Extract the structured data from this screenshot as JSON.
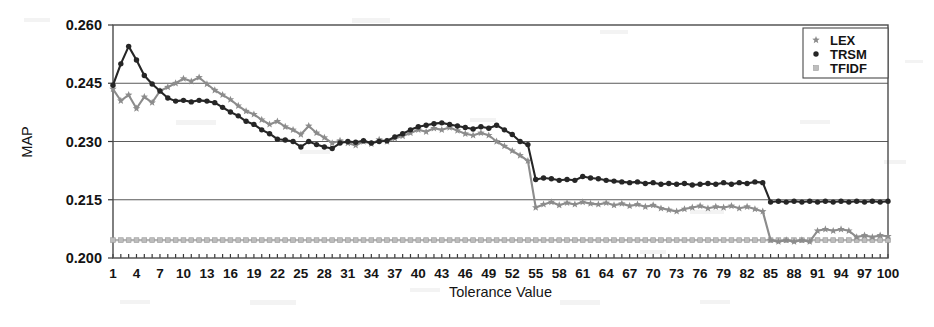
{
  "chart_data": {
    "type": "line",
    "title": "",
    "xlabel": "Tolerance Value",
    "ylabel": "MAP",
    "xlim": [
      1,
      100
    ],
    "ylim": [
      0.2,
      0.26
    ],
    "yticks": [
      "0.200",
      "0.215",
      "0.230",
      "0.245",
      "0.260"
    ],
    "xticks": [
      1,
      4,
      7,
      10,
      13,
      16,
      19,
      22,
      25,
      28,
      31,
      34,
      37,
      40,
      43,
      46,
      49,
      52,
      55,
      58,
      61,
      64,
      67,
      70,
      73,
      76,
      79,
      82,
      85,
      88,
      91,
      94,
      97,
      100
    ],
    "grid": true,
    "legend_position": "top-right",
    "x": [
      1,
      2,
      3,
      4,
      5,
      6,
      7,
      8,
      9,
      10,
      11,
      12,
      13,
      14,
      15,
      16,
      17,
      18,
      19,
      20,
      21,
      22,
      23,
      24,
      25,
      26,
      27,
      28,
      29,
      30,
      31,
      32,
      33,
      34,
      35,
      36,
      37,
      38,
      39,
      40,
      41,
      42,
      43,
      44,
      45,
      46,
      47,
      48,
      49,
      50,
      51,
      52,
      53,
      54,
      55,
      56,
      57,
      58,
      59,
      60,
      61,
      62,
      63,
      64,
      65,
      66,
      67,
      68,
      69,
      70,
      71,
      72,
      73,
      74,
      75,
      76,
      77,
      78,
      79,
      80,
      81,
      82,
      83,
      84,
      85,
      86,
      87,
      88,
      89,
      90,
      91,
      92,
      93,
      94,
      95,
      96,
      97,
      98,
      99,
      100
    ],
    "series": [
      {
        "name": "LEX",
        "marker": "star",
        "color": "#8c8c8c",
        "values": [
          0.2435,
          0.2405,
          0.242,
          0.2385,
          0.2415,
          0.24,
          0.243,
          0.244,
          0.245,
          0.2462,
          0.2455,
          0.2465,
          0.2448,
          0.2432,
          0.242,
          0.2408,
          0.2392,
          0.2378,
          0.237,
          0.2356,
          0.2344,
          0.2352,
          0.2338,
          0.233,
          0.2318,
          0.234,
          0.2322,
          0.231,
          0.2296,
          0.2302,
          0.2296,
          0.229,
          0.23,
          0.2294,
          0.2305,
          0.23,
          0.2308,
          0.2314,
          0.2322,
          0.233,
          0.2325,
          0.2334,
          0.233,
          0.2336,
          0.2328,
          0.232,
          0.2316,
          0.2322,
          0.2316,
          0.23,
          0.2288,
          0.2276,
          0.2264,
          0.225,
          0.213,
          0.2138,
          0.2144,
          0.2136,
          0.2142,
          0.2138,
          0.2144,
          0.214,
          0.2138,
          0.2142,
          0.2136,
          0.214,
          0.2134,
          0.2138,
          0.2132,
          0.2136,
          0.2128,
          0.2124,
          0.212,
          0.2126,
          0.213,
          0.2134,
          0.2128,
          0.2132,
          0.213,
          0.2134,
          0.2128,
          0.2132,
          0.2126,
          0.212,
          0.2046,
          0.2042,
          0.2046,
          0.2042,
          0.2046,
          0.2042,
          0.207,
          0.2074,
          0.207,
          0.2074,
          0.207,
          0.2054,
          0.2058,
          0.2054,
          0.2058,
          0.2056
        ]
      },
      {
        "name": "TRSM",
        "marker": "circle",
        "color": "#262626",
        "values": [
          0.2445,
          0.25,
          0.2545,
          0.251,
          0.247,
          0.2448,
          0.243,
          0.2412,
          0.2404,
          0.2406,
          0.2402,
          0.2406,
          0.2404,
          0.24,
          0.2388,
          0.2376,
          0.2366,
          0.2352,
          0.2344,
          0.233,
          0.232,
          0.2306,
          0.2304,
          0.23,
          0.2286,
          0.23,
          0.2292,
          0.2286,
          0.2282,
          0.2296,
          0.23,
          0.2298,
          0.2302,
          0.2296,
          0.23,
          0.2302,
          0.2312,
          0.232,
          0.233,
          0.2338,
          0.2342,
          0.2346,
          0.2348,
          0.2344,
          0.234,
          0.2336,
          0.2332,
          0.2338,
          0.2334,
          0.2342,
          0.233,
          0.2318,
          0.23,
          0.2292,
          0.2202,
          0.2206,
          0.2204,
          0.22,
          0.2202,
          0.22,
          0.221,
          0.2206,
          0.2204,
          0.22,
          0.2198,
          0.2196,
          0.2194,
          0.2196,
          0.2192,
          0.2194,
          0.219,
          0.2192,
          0.219,
          0.2192,
          0.2188,
          0.219,
          0.2192,
          0.219,
          0.2194,
          0.219,
          0.2194,
          0.2192,
          0.2196,
          0.2194,
          0.2144,
          0.2146,
          0.2144,
          0.2146,
          0.2144,
          0.2146,
          0.2144,
          0.2146,
          0.2144,
          0.2146,
          0.2144,
          0.2146,
          0.2144,
          0.2146,
          0.2144,
          0.2146
        ]
      },
      {
        "name": "TFIDF",
        "marker": "square",
        "color": "#bdbdbd",
        "values": [
          0.2046,
          0.2046,
          0.2046,
          0.2046,
          0.2046,
          0.2046,
          0.2046,
          0.2046,
          0.2046,
          0.2046,
          0.2046,
          0.2046,
          0.2046,
          0.2046,
          0.2046,
          0.2046,
          0.2046,
          0.2046,
          0.2046,
          0.2046,
          0.2046,
          0.2046,
          0.2046,
          0.2046,
          0.2046,
          0.2046,
          0.2046,
          0.2046,
          0.2046,
          0.2046,
          0.2046,
          0.2046,
          0.2046,
          0.2046,
          0.2046,
          0.2046,
          0.2046,
          0.2046,
          0.2046,
          0.2046,
          0.2046,
          0.2046,
          0.2046,
          0.2046,
          0.2046,
          0.2046,
          0.2046,
          0.2046,
          0.2046,
          0.2046,
          0.2046,
          0.2046,
          0.2046,
          0.2046,
          0.2046,
          0.2046,
          0.2046,
          0.2046,
          0.2046,
          0.2046,
          0.2046,
          0.2046,
          0.2046,
          0.2046,
          0.2046,
          0.2046,
          0.2046,
          0.2046,
          0.2046,
          0.2046,
          0.2046,
          0.2046,
          0.2046,
          0.2046,
          0.2046,
          0.2046,
          0.2046,
          0.2046,
          0.2046,
          0.2046,
          0.2046,
          0.2046,
          0.2046,
          0.2046,
          0.2046,
          0.2046,
          0.2046,
          0.2046,
          0.2046,
          0.2046,
          0.2046,
          0.2046,
          0.2046,
          0.2046,
          0.2046,
          0.2046,
          0.2046,
          0.2046,
          0.2046,
          0.2046
        ]
      }
    ],
    "legend": [
      {
        "label": "LEX",
        "marker": "star",
        "color": "#8c8c8c"
      },
      {
        "label": "TRSM",
        "marker": "circle",
        "color": "#262626"
      },
      {
        "label": "TFIDF",
        "marker": "square",
        "color": "#bdbdbd"
      }
    ]
  }
}
